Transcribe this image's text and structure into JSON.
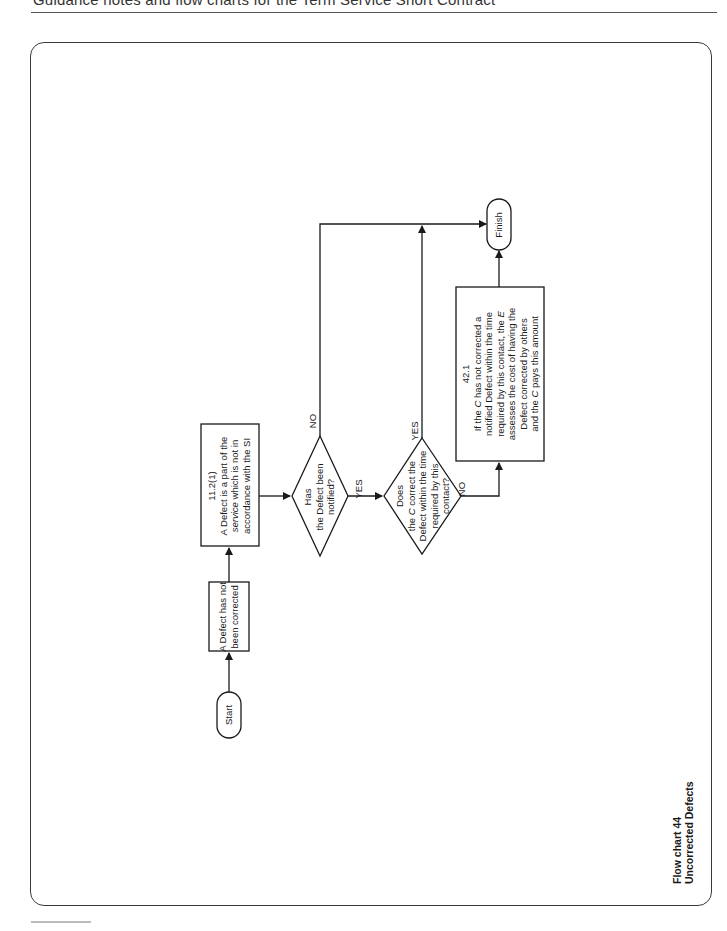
{
  "page": {
    "header": "Guidance notes and flow charts for the Term Service Short Contract"
  },
  "chart": {
    "caption_line1": "Flow chart 44",
    "caption_line2": "Uncorrected Defects",
    "nodes": {
      "start": {
        "label": "Start"
      },
      "not_corrected": {
        "line1": "A Defect has not",
        "line2": "been corrected"
      },
      "clause_11_2_1": {
        "ref": "11.2(1)",
        "line1": "A Defect is a part of the",
        "line2_a": "service",
        "line2_b": " which is not in",
        "line3": "accordance with the SI"
      },
      "decision_notified": {
        "line1": "Has",
        "line2": "the Defect been",
        "line3": "notified?"
      },
      "decision_corrected": {
        "line1": "Does",
        "line2_a": "the ",
        "line2_b": "C",
        "line2_c": " correct the",
        "line3": "Defect within the time",
        "line4": "required by this",
        "line5": "contact?"
      },
      "clause_42_1": {
        "ref": "42.1",
        "line1_a": "If the ",
        "line1_b": "C",
        "line1_c": " has not corrected a",
        "line2": "notified Defect within the time",
        "line3_a": "required by this contact, the ",
        "line3_b": "E",
        "line4": "assesses the cost of having the",
        "line5": "Defect corrected by others",
        "line6_a": "and the ",
        "line6_b": "C",
        "line6_c": " pays this amount"
      },
      "finish": {
        "label": "Finish"
      }
    },
    "edges": {
      "notified_no": "NO",
      "notified_yes": "YES",
      "corrected_yes": "YES",
      "corrected_no": "NO"
    },
    "colors": {
      "stroke": "#1a1a1a",
      "frame": "#3a3a3a"
    }
  }
}
